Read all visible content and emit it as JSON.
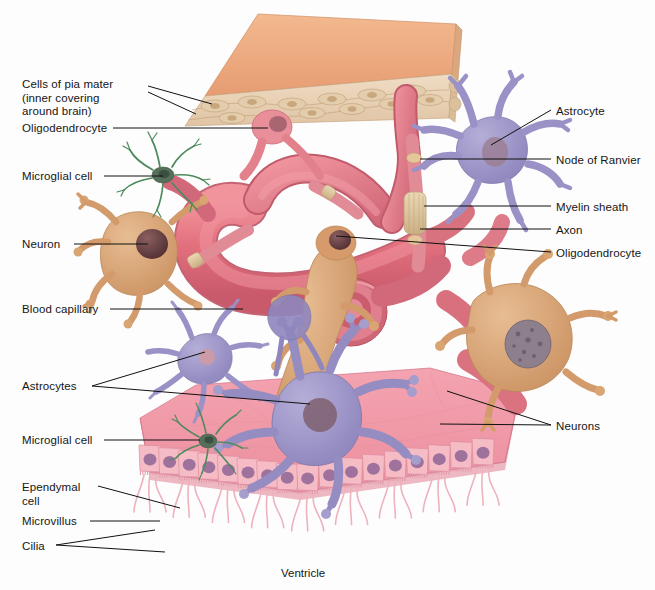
{
  "figure": {
    "background": "#fdfdfd",
    "caption": "Ventricle",
    "caption_pos": [
      281,
      567
    ]
  },
  "labels_left": [
    {
      "id": "pia-mater",
      "text": "Cells of pia mater\n(inner covering\naround brain)",
      "x": 22,
      "y": 78,
      "leaders": [
        [
          148,
          86,
          212,
          104
        ],
        [
          148,
          92,
          196,
          114
        ]
      ]
    },
    {
      "id": "oligodendrocyte-top",
      "text": "Oligodendrocyte",
      "x": 22,
      "y": 122,
      "leaders": [
        [
          113,
          128,
          268,
          128
        ]
      ]
    },
    {
      "id": "microglial-cell-top",
      "text": "Microglial cell",
      "x": 22,
      "y": 170,
      "leaders": [
        [
          104,
          176,
          163,
          176
        ]
      ]
    },
    {
      "id": "neuron",
      "text": "Neuron",
      "x": 22,
      "y": 238,
      "leaders": [
        [
          74,
          244,
          148,
          244
        ]
      ]
    },
    {
      "id": "blood-capillary",
      "text": "Blood capillary",
      "x": 22,
      "y": 303,
      "leaders": [
        [
          110,
          309,
          243,
          309
        ]
      ]
    },
    {
      "id": "astrocytes",
      "text": "Astrocytes",
      "x": 22,
      "y": 380,
      "leaders": [
        [
          92,
          386,
          205,
          352
        ],
        [
          92,
          386,
          310,
          404
        ]
      ]
    },
    {
      "id": "microglial-cell-bottom",
      "text": "Microglial cell",
      "x": 22,
      "y": 434,
      "leaders": [
        [
          104,
          440,
          200,
          440
        ]
      ]
    },
    {
      "id": "ependymal-cell",
      "text": "Ependymal\ncell",
      "x": 22,
      "y": 481,
      "leaders": [
        [
          98,
          486,
          180,
          508
        ]
      ]
    },
    {
      "id": "microvillus",
      "text": "Microvillus",
      "x": 22,
      "y": 515,
      "leaders": [
        [
          90,
          521,
          160,
          521
        ]
      ]
    },
    {
      "id": "cilia",
      "text": "Cilia",
      "x": 22,
      "y": 540,
      "leaders": [
        [
          56,
          545,
          155,
          530
        ],
        [
          56,
          545,
          165,
          552
        ]
      ]
    }
  ],
  "labels_right": [
    {
      "id": "astrocyte",
      "text": "Astrocyte",
      "x": 556,
      "y": 105,
      "leaders": [
        [
          551,
          110,
          491,
          145
        ]
      ]
    },
    {
      "id": "node-of-ranvier",
      "text": "Node of Ranvier",
      "x": 556,
      "y": 154,
      "leaders": [
        [
          551,
          159,
          420,
          159
        ]
      ]
    },
    {
      "id": "myelin-sheath",
      "text": "Myelin sheath",
      "x": 556,
      "y": 201,
      "leaders": [
        [
          551,
          206,
          424,
          206
        ]
      ]
    },
    {
      "id": "axon",
      "text": "Axon",
      "x": 556,
      "y": 224,
      "leaders": [
        [
          551,
          229,
          420,
          229
        ]
      ]
    },
    {
      "id": "oligodendrocyte-right",
      "text": "Oligodendrocyte",
      "x": 556,
      "y": 247,
      "leaders": [
        [
          551,
          252,
          336,
          236
        ]
      ]
    },
    {
      "id": "neurons",
      "text": "Neurons",
      "x": 556,
      "y": 420,
      "leaders": [
        [
          551,
          425,
          447,
          391
        ],
        [
          551,
          425,
          440,
          424
        ]
      ]
    }
  ],
  "colors": {
    "pia_mater_top": "#eea87d",
    "pia_mater_slab": "#e8cfb2",
    "capillary": "#e2707d",
    "capillary_light": "#eb8c93",
    "neuron_body": "#d9a272",
    "neuron_nucleus": "#5e3a3c",
    "astrocyte": "#9a92c6",
    "microglia": "#3f7a4e",
    "ependymal": "#f2a8b4",
    "ependymal_nucleus": "#7b5a88",
    "myelin": "#dcc39a",
    "leader": "#111111",
    "text": "#151515"
  }
}
